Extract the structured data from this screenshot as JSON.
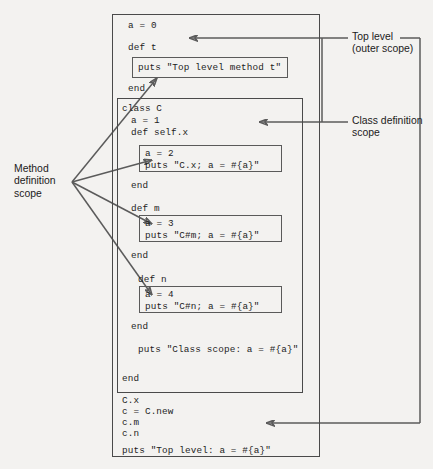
{
  "diagram": {
    "colors": {
      "line": "#5b5b5b",
      "box": "#4a4a4a",
      "text": "#1d1d1d",
      "background": "#f3f2f0"
    }
  },
  "code": {
    "top_a": "a = 0",
    "def_t": "def t",
    "box_t": "puts \"Top level method t\"",
    "end_t": "end",
    "class_c": "class C",
    "class_a": "a = 1",
    "def_selfx": "def self.x",
    "box_x_line1": "a = 2",
    "box_x_line2": "puts \"C.x; a = #{a}\"",
    "end_x": "end",
    "def_m": "def m",
    "box_m_line1": "a = 3",
    "box_m_line2": "puts \"C#m; a = #{a}\"",
    "end_m": "end",
    "def_n": "def n",
    "box_n_line1": "a = 4",
    "box_n_line2": "puts \"C#n; a = #{a}\"",
    "end_n": "end",
    "puts_class_scope": "puts \"Class scope: a = #{a}\"",
    "end_class": "end",
    "call_cx": "C.x",
    "call_cnew": "c = C.new",
    "call_cm": "c.m",
    "call_cn": "c.n",
    "puts_top_level": "puts \"Top level: a = #{a}\""
  },
  "annotations": {
    "top_level": "Top level\n(outer scope)",
    "class_definition": "Class definition\nscope",
    "method_definition": "Method\ndefinition\nscope"
  }
}
